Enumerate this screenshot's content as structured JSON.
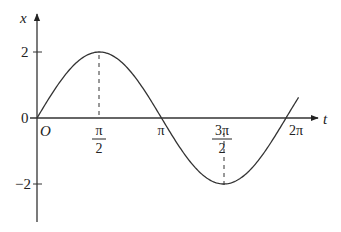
{
  "chart_data": {
    "type": "line",
    "title": "",
    "function": "x = 2 sin t",
    "xlabel": "t",
    "ylabel": "x",
    "origin_label": "O",
    "x_ticks": [
      {
        "value": 1.5708,
        "label_num": "π",
        "label_den": "2"
      },
      {
        "value": 3.1416,
        "label": "π"
      },
      {
        "value": 4.7124,
        "label_num": "3π",
        "label_den": "2"
      },
      {
        "value": 6.2832,
        "label": "2π"
      }
    ],
    "y_ticks": [
      {
        "value": 2,
        "label": "2"
      },
      {
        "value": 0,
        "label": "0"
      },
      {
        "value": -2,
        "label": "−2"
      }
    ],
    "x": [
      0,
      0.7854,
      1.5708,
      2.3562,
      3.1416,
      3.927,
      4.7124,
      5.4978,
      6.2832,
      6.6
    ],
    "series": [
      {
        "name": "x(t)",
        "values": [
          0,
          1.414,
          2,
          1.414,
          0,
          -1.414,
          -2,
          -1.414,
          0,
          0.62
        ]
      }
    ],
    "xlim": [
      0,
      6.6
    ],
    "ylim": [
      -3,
      3
    ],
    "grid": false,
    "annotations": [
      "dashed vertical line from peak (π/2, 2) to t-axis",
      "dashed vertical line from trough (3π/2, -2) to t-axis"
    ],
    "stroke_color": "#333333"
  }
}
